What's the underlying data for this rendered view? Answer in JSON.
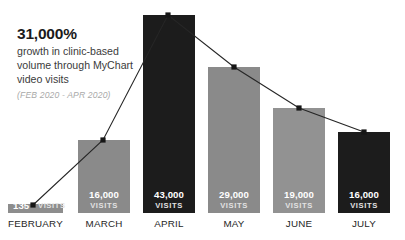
{
  "annotation": {
    "headline": "31,000%",
    "body_line1": "growth in clinic-based",
    "body_line2": "volume through MyChart",
    "body_line3": "video visits",
    "period": "(FEB 2020 - APR 2020)"
  },
  "chart_data": {
    "type": "bar",
    "title": "31,000% growth in clinic-based volume through MyChart video visits",
    "subtitle": "(FEB 2020 - APR 2020)",
    "xlabel": "",
    "ylabel": "",
    "ylim": [
      0,
      43000
    ],
    "grid": false,
    "legend": "none",
    "value_unit": "VISITS",
    "categories": [
      "FEBRUARY",
      "MARCH",
      "APRIL",
      "MAY",
      "JUNE",
      "JULY"
    ],
    "values": [
      135,
      16000,
      43000,
      29000,
      19000,
      16000
    ],
    "value_labels": [
      "135",
      "16,000",
      "43,000",
      "29,000",
      "19,000",
      "16,000"
    ],
    "bar_colors": [
      "#8d8d8d",
      "#8a8a8a",
      "#1c1c1c",
      "#8a8a8a",
      "#929292",
      "#1c1c1c"
    ],
    "series": [
      {
        "name": "Visits (bars)",
        "type": "bar",
        "values": [
          135,
          16000,
          43000,
          29000,
          19000,
          16000
        ]
      },
      {
        "name": "Trend (line)",
        "type": "line",
        "color": "#262626",
        "marker": "square",
        "values": [
          135,
          16000,
          43000,
          29000,
          19000,
          16000
        ]
      }
    ],
    "bars": [
      {
        "label": "FEBRUARY",
        "value": 135,
        "value_text": "135",
        "unit": "VISITS",
        "color": "#8d8d8d",
        "x": 8,
        "width": 55,
        "top": 204,
        "bottom": 213,
        "point_x": 33,
        "point_y": 205
      },
      {
        "label": "MARCH",
        "value": 16000,
        "value_text": "16,000",
        "unit": "VISITS",
        "color": "#8a8a8a",
        "x": 78,
        "width": 52,
        "top": 140,
        "bottom": 213,
        "point_x": 103,
        "point_y": 140
      },
      {
        "label": "APRIL",
        "value": 43000,
        "value_text": "43,000",
        "unit": "VISITS",
        "color": "#1c1c1c",
        "x": 143,
        "width": 52,
        "top": 15,
        "bottom": 213,
        "point_x": 168,
        "point_y": 15
      },
      {
        "label": "MAY",
        "value": 29000,
        "value_text": "29,000",
        "unit": "VISITS",
        "color": "#8a8a8a",
        "x": 208,
        "width": 52,
        "top": 67,
        "bottom": 213,
        "point_x": 234,
        "point_y": 67
      },
      {
        "label": "JUNE",
        "value": 19000,
        "value_text": "19,000",
        "unit": "VISITS",
        "color": "#929292",
        "x": 273,
        "width": 52,
        "top": 108,
        "bottom": 213,
        "point_x": 299,
        "point_y": 108
      },
      {
        "label": "JULY",
        "value": 16000,
        "value_text": "16,000",
        "unit": "VISITS",
        "color": "#1c1c1c",
        "x": 338,
        "width": 52,
        "top": 132,
        "bottom": 213,
        "point_x": 364,
        "point_y": 132
      }
    ]
  }
}
